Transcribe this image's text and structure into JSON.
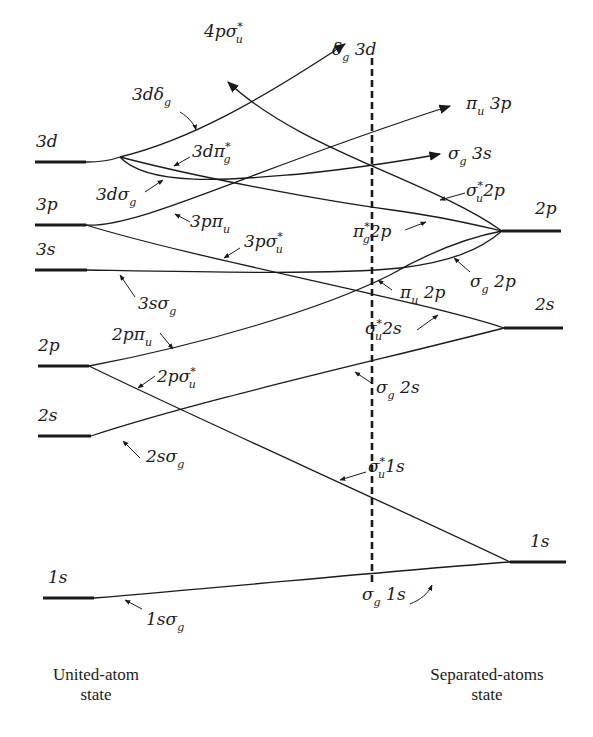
{
  "diagram": {
    "left_caption": [
      "United-atom",
      "state"
    ],
    "right_caption": [
      "Separated-atoms",
      "state"
    ],
    "left_levels": [
      "3d",
      "3p",
      "3s",
      "2p",
      "2s",
      "1s"
    ],
    "right_levels": [
      "2p",
      "2s",
      "1s"
    ],
    "united_atom_labels": {
      "d3_delta_g": {
        "main": "3dδ",
        "sub": "g"
      },
      "d3_pi_g_star": {
        "main": "3dπ",
        "sub": "g",
        "sup": "*"
      },
      "d3_sigma_g": {
        "main": "3dσ",
        "sub": "g"
      },
      "p4_sigma_u_star": {
        "main": "4pσ",
        "sub": "u",
        "sup": "*"
      },
      "p3_pi_u": {
        "main": "3pπ",
        "sub": "u"
      },
      "p3_sigma_u_star": {
        "main": "3pσ",
        "sub": "u",
        "sup": "*"
      },
      "s3_sigma_g": {
        "main": "3sσ",
        "sub": "g"
      },
      "p2_pi_u": {
        "main": "2pπ",
        "sub": "u"
      },
      "p2_sigma_u_star": {
        "main": "2pσ",
        "sub": "u",
        "sup": "*"
      },
      "s2_sigma_g": {
        "main": "2sσ",
        "sub": "g"
      },
      "s1_sigma_g": {
        "main": "1sσ",
        "sub": "g"
      }
    },
    "separated_atom_labels": {
      "delta_g_3d": {
        "main": "δ",
        "sub": "g",
        "rest": " 3d"
      },
      "pi_u_3p": {
        "main": "π",
        "sub": "u",
        "rest": " 3p"
      },
      "sigma_g_3s": {
        "main": "σ",
        "sub": "g",
        "rest": " 3s"
      },
      "sigma_u_star_2p": {
        "main": "σ",
        "sub": "u",
        "sup": "*",
        "rest": "2p"
      },
      "pi_g_star_2p": {
        "main": "π",
        "sub": "g",
        "sup": "*",
        "rest": "2p"
      },
      "sigma_g_2p": {
        "main": "σ",
        "sub": "g",
        "rest": " 2p"
      },
      "pi_u_2p": {
        "main": "π",
        "sub": "u",
        "rest": " 2p"
      },
      "sigma_u_star_2s": {
        "main": "σ",
        "sub": "u",
        "sup": "*",
        "rest": "2s"
      },
      "sigma_g_2s": {
        "main": "σ",
        "sub": "g",
        "rest": " 2s"
      },
      "sigma_u_star_1s": {
        "main": "σ",
        "sub": "u",
        "sup": "*",
        "rest": "1s"
      },
      "sigma_g_1s": {
        "main": "σ",
        "sub": "g",
        "rest": " 1s"
      }
    },
    "colors": {
      "ink": "#1a1a1a",
      "background": "#ffffff"
    }
  }
}
